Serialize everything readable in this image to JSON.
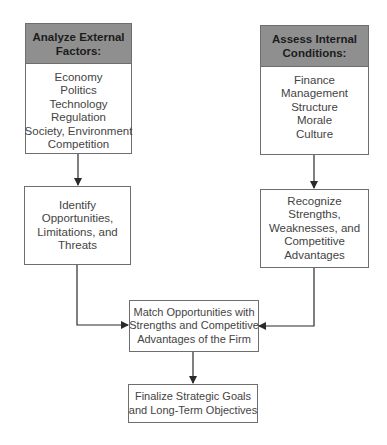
{
  "diagram": {
    "external": {
      "header": [
        "Analyze External",
        "Factors:"
      ],
      "items": [
        "Economy",
        "Politics",
        "Technology",
        "Regulation",
        "Society, Environment",
        "Competition"
      ]
    },
    "internal": {
      "header": [
        "Assess Internal",
        "Conditions:"
      ],
      "items": [
        "Finance",
        "Management",
        "Structure",
        "Morale",
        "Culture"
      ]
    },
    "identify": {
      "lines": [
        "Identify",
        "Opportunities,",
        "Limitations, and",
        "Threats"
      ]
    },
    "recognize": {
      "lines": [
        "Recognize",
        "Strengths,",
        "Weaknesses, and",
        "Competitive",
        "Advantages"
      ]
    },
    "match": {
      "lines": [
        "Match Opportunities with",
        "Strengths and Competitive",
        "Advantages of the Firm"
      ]
    },
    "finalize": {
      "lines": [
        "Finalize Strategic Goals",
        "and Long-Term Objectives"
      ]
    },
    "colors": {
      "header_fill": "#8f8f8f",
      "border": "#6e6e6e",
      "text": "#444444"
    }
  }
}
